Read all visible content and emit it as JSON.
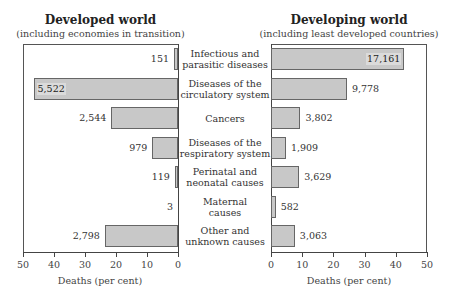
{
  "chart_data": [
    {
      "type": "bar",
      "orientation": "horizontal",
      "title": "Developed world",
      "subtitle": "(including economies in transition)",
      "xlabel": "Deaths (per cent)",
      "ylabel": "",
      "xlim": [
        50,
        0
      ],
      "xticks": [
        50,
        40,
        30,
        20,
        10,
        0
      ],
      "direction": "right-to-left",
      "grid": false,
      "categories": [
        "Infectious and parasitic diseases",
        "Diseases of the circulatory system",
        "Cancers",
        "Diseases of the respiratory system",
        "Perinatal and neonatal causes",
        "Maternal causes",
        "Other and unknown causes"
      ],
      "values_percent": [
        1.3,
        46.6,
        21.5,
        8.3,
        1.0,
        0.0,
        23.6
      ],
      "labels": [
        "151",
        "5,522",
        "2,544",
        "979",
        "119",
        "3",
        "2,798"
      ],
      "values": [
        151,
        5522,
        2544,
        979,
        119,
        3,
        2798
      ]
    },
    {
      "type": "bar",
      "orientation": "horizontal",
      "title": "Developing world",
      "subtitle": "(including least developed countries)",
      "xlabel": "Deaths (per cent)",
      "ylabel": "",
      "xlim": [
        0,
        50
      ],
      "xticks": [
        0,
        10,
        20,
        30,
        40,
        50
      ],
      "direction": "left-to-right",
      "grid": false,
      "categories": [
        "Infectious and parasitic diseases",
        "Diseases of the circulatory system",
        "Cancers",
        "Diseases of the respiratory system",
        "Perinatal and neonatal causes",
        "Maternal causes",
        "Other and unknown causes"
      ],
      "values_percent": [
        43.0,
        24.5,
        9.5,
        4.8,
        9.1,
        1.5,
        7.7
      ],
      "labels": [
        "17,161",
        "9,778",
        "3,802",
        "1,909",
        "3,629",
        "582",
        "3,063"
      ],
      "values": [
        17161,
        9778,
        3802,
        1909,
        3629,
        582,
        3063
      ]
    }
  ],
  "left": {
    "title": "Developed world",
    "subtitle": "(including economies in transition)",
    "xlabel": "Deaths (per cent)",
    "ticks": [
      "50",
      "40",
      "30",
      "20",
      "10",
      "0"
    ],
    "labels": [
      "151",
      "5,522",
      "2,544",
      "979",
      "119",
      "3",
      "2,798"
    ]
  },
  "right": {
    "title": "Developing world",
    "subtitle": "(including least developed countries)",
    "xlabel": "Deaths (per cent)",
    "ticks": [
      "0",
      "10",
      "20",
      "30",
      "40",
      "50"
    ],
    "labels": [
      "17,161",
      "9,778",
      "3,802",
      "1,909",
      "3,629",
      "582",
      "3,063"
    ]
  },
  "categories": [
    "Infectious and\nparasitic diseases",
    "Diseases of the\ncirculatory system",
    "Cancers",
    "Diseases of the\nrespiratory system",
    "Perinatal and\nneonatal causes",
    "Maternal\ncauses",
    "Other and\nunknown causes"
  ],
  "colors": {
    "bar_fill": "#c8c8c8",
    "bar_border": "#666666",
    "axis": "#444444"
  }
}
